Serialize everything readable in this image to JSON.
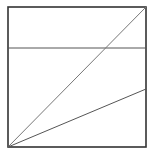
{
  "diagram": {
    "width": 155,
    "height": 160,
    "background": "#ffffff",
    "frame": {
      "x": 8,
      "y": 7,
      "width": 138,
      "height": 140,
      "stroke": "#333333",
      "stroke_width": 1.6
    },
    "lines": [
      {
        "name": "horizontal-line",
        "x1": 8,
        "y1": 48,
        "x2": 146,
        "y2": 48,
        "stroke": "#555555",
        "stroke_width": 1
      },
      {
        "name": "steep-diagonal-line",
        "x1": 8,
        "y1": 147,
        "x2": 146,
        "y2": 7,
        "stroke": "#777777",
        "stroke_width": 1
      },
      {
        "name": "shallow-diagonal-line",
        "x1": 8,
        "y1": 147,
        "x2": 146,
        "y2": 89,
        "stroke": "#555555",
        "stroke_width": 1
      }
    ]
  }
}
